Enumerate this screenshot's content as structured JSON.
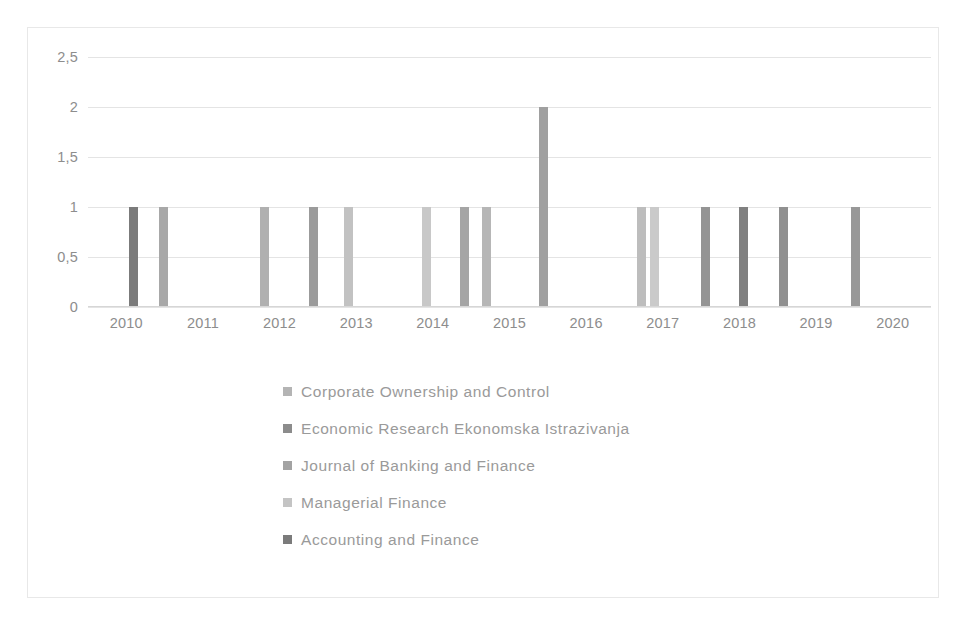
{
  "chart_data": {
    "type": "bar",
    "title": "",
    "xlabel": "",
    "ylabel": "",
    "grid": true,
    "legend_position": "bottom",
    "ylim": [
      0,
      2.5
    ],
    "ytick_labels": [
      "2,5",
      "2",
      "1,5",
      "1",
      "0,5",
      "0"
    ],
    "ytick_values": [
      2.5,
      2,
      1.5,
      1,
      0.5,
      0
    ],
    "categories": [
      "2010",
      "2011",
      "2012",
      "2013",
      "2014",
      "2015",
      "2016",
      "2017",
      "2018",
      "2019",
      "2020"
    ],
    "xlim": [
      2009.5,
      2020.5
    ],
    "series": [
      {
        "name": "Corporate Ownership and Control",
        "color": "#b4b4b4",
        "points": [
          {
            "x": 2010.25,
            "y": 1
          },
          {
            "x": 2014.0,
            "y": 1
          },
          {
            "x": 2014.55,
            "y": 1
          },
          {
            "x": 2017.05,
            "y": 1
          }
        ]
      },
      {
        "name": "Economic Research Ekonomska Istrazivanja",
        "color": "#8c8c8c",
        "points": [
          {
            "x": 2012.0,
            "y": 1
          },
          {
            "x": 2015.0,
            "y": 1
          },
          {
            "x": 2015.75,
            "y": 2
          }
        ]
      },
      {
        "name": "Journal of Banking and Finance",
        "color": "#a3a3a3",
        "points": [
          {
            "x": 2010.65,
            "y": 1
          },
          {
            "x": 2013.1,
            "y": 1
          },
          {
            "x": 2016.95,
            "y": 1
          }
        ]
      },
      {
        "name": "Managerial Finance",
        "color": "#c4c4c4",
        "points": [
          {
            "x": 2012.65,
            "y": 1
          },
          {
            "x": 2019.75,
            "y": 1
          }
        ]
      },
      {
        "name": "Accounting and Finance",
        "color": "#7b7b7b",
        "points": [
          {
            "x": 2010.1,
            "y": 1
          },
          {
            "x": 2018.0,
            "y": 1
          },
          {
            "x": 2018.5,
            "y": 1
          },
          {
            "x": 2019.0,
            "y": 1
          }
        ]
      }
    ],
    "bars": [
      {
        "x": 2010.1,
        "y": 1,
        "color": "#7b7b7b",
        "series": "Accounting and Finance"
      },
      {
        "x": 2010.48,
        "y": 1,
        "color": "#a8a8a8",
        "series": "Journal of Banking and Finance"
      },
      {
        "x": 2011.8,
        "y": 1,
        "color": "#b0b0b0",
        "series": "Corporate Ownership and Control"
      },
      {
        "x": 2012.44,
        "y": 1,
        "color": "#9b9b9b",
        "series": "Economic Research Ekonomska Istrazivanja"
      },
      {
        "x": 2012.9,
        "y": 1,
        "color": "#c2c2c2",
        "series": "Managerial Finance"
      },
      {
        "x": 2013.92,
        "y": 1,
        "color": "#c8c8c8",
        "series": "Managerial Finance"
      },
      {
        "x": 2014.41,
        "y": 1,
        "color": "#a5a5a5",
        "series": "Corporate Ownership and Control"
      },
      {
        "x": 2014.7,
        "y": 1,
        "color": "#b6b6b6",
        "series": "Journal of Banking and Finance"
      },
      {
        "x": 2015.44,
        "y": 2,
        "color": "#a0a0a0",
        "series": "Economic Research Ekonomska Istrazivanja"
      },
      {
        "x": 2016.72,
        "y": 1,
        "color": "#bdbdbd",
        "series": "Corporate Ownership and Control"
      },
      {
        "x": 2016.89,
        "y": 1,
        "color": "#cacaca",
        "series": "Managerial Finance"
      },
      {
        "x": 2017.56,
        "y": 1,
        "color": "#949494",
        "series": "Accounting and Finance"
      },
      {
        "x": 2018.05,
        "y": 1,
        "color": "#808080",
        "series": "Accounting and Finance"
      },
      {
        "x": 2018.57,
        "y": 1,
        "color": "#909090",
        "series": "Accounting and Finance"
      },
      {
        "x": 2019.52,
        "y": 1,
        "color": "#989898",
        "series": "Corporate Ownership and Control"
      }
    ]
  }
}
